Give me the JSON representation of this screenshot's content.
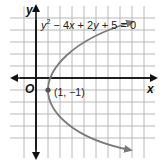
{
  "graph": {
    "equation": "y² − 4x + 2y + 5 = 0",
    "equation_parts": {
      "y": "y",
      "sup": "2",
      "rest1": " − 4",
      "x": "x",
      "rest2": " + 2",
      "y2": "y",
      "rest3": " + 5 = 0"
    },
    "x_axis_label": "x",
    "y_axis_label": "y",
    "origin_label": "O",
    "vertex_label": "(1, −1)",
    "vertex": [
      1,
      -1
    ],
    "colors": {
      "grid": "#b8b8b8",
      "axis": "#111111",
      "curve": "#7a7a7a",
      "point": "#555555"
    }
  }
}
